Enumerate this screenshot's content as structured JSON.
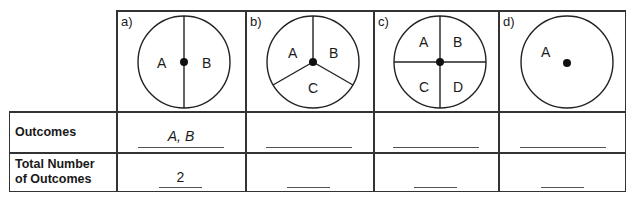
{
  "columns": [
    {
      "id": "a",
      "label": "a)",
      "sections": [
        "A",
        "B"
      ],
      "outcomes": "A, B",
      "total": "2"
    },
    {
      "id": "b",
      "label": "b)",
      "sections": [
        "A",
        "B",
        "C"
      ],
      "outcomes": "",
      "total": ""
    },
    {
      "id": "c",
      "label": "c)",
      "sections": [
        "A",
        "B",
        "C",
        "D"
      ],
      "outcomes": "",
      "total": ""
    },
    {
      "id": "d",
      "label": "d)",
      "sections": [
        "A"
      ],
      "outcomes": "",
      "total": ""
    }
  ],
  "rows": {
    "outcomes_label": "Outcomes",
    "total_label_line1": "Total Number",
    "total_label_line2": "of Outcomes"
  }
}
